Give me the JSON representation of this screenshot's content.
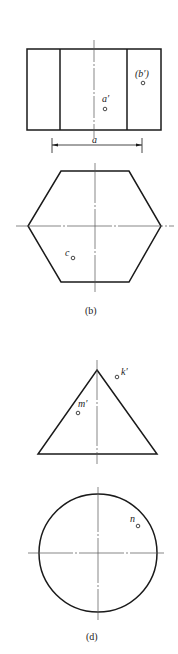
{
  "figure_b": {
    "caption": "(b)",
    "front_view": {
      "point_a_label": "a′",
      "point_b_label": "(b′)",
      "dimension_label": "a"
    },
    "top_view": {
      "point_c_label": "c"
    }
  },
  "figure_d": {
    "caption": "(d)",
    "front_view": {
      "point_k_label": "k′",
      "point_m_label": "m′"
    },
    "top_view": {
      "point_n_label": "n"
    }
  },
  "colors": {
    "line": "#1a1a1a",
    "axis": "#555555",
    "background": "#ffffff"
  }
}
